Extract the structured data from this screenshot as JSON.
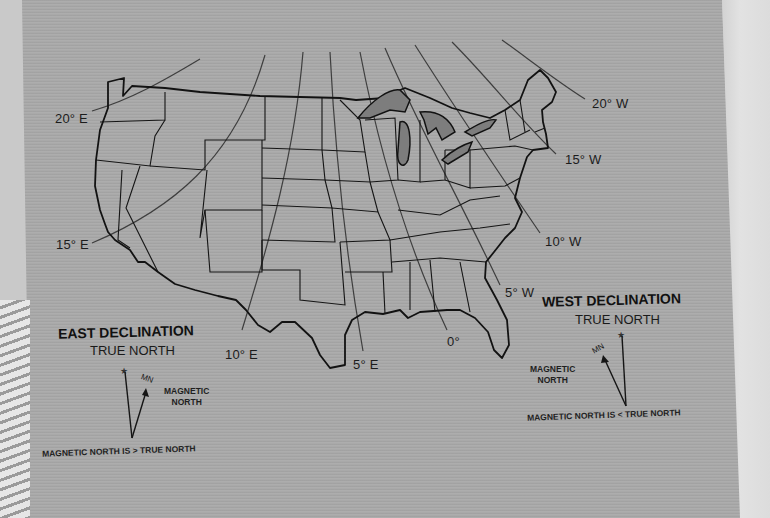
{
  "map": {
    "subject": "Magnetic declination across the United States",
    "isogonic_lines": [
      {
        "label": "20° E"
      },
      {
        "label": "15° E"
      },
      {
        "label": "10° E"
      },
      {
        "label": "5° E"
      },
      {
        "label": "0°"
      },
      {
        "label": "5° W"
      },
      {
        "label": "10° W"
      },
      {
        "label": "15° W"
      },
      {
        "label": "20° W"
      }
    ],
    "highlighted_feature": "Great Lakes"
  },
  "east_declination": {
    "title": "EAST DECLINATION",
    "true_north": "TRUE NORTH",
    "mn_label": "MN",
    "magnetic_north": "MAGNETIC\nNORTH",
    "caption": "MAGNETIC NORTH IS > TRUE NORTH"
  },
  "west_declination": {
    "title": "WEST DECLINATION",
    "true_north": "TRUE NORTH",
    "mn_label": "MN",
    "magnetic_north": "MAGNETIC\nNORTH",
    "caption": "MAGNETIC NORTH IS < TRUE NORTH"
  },
  "colors": {
    "paper": "#a9a9a9",
    "ink": "#111111",
    "isogonic_line": "#3a3a3a",
    "lakes": "#7d7d7d"
  }
}
